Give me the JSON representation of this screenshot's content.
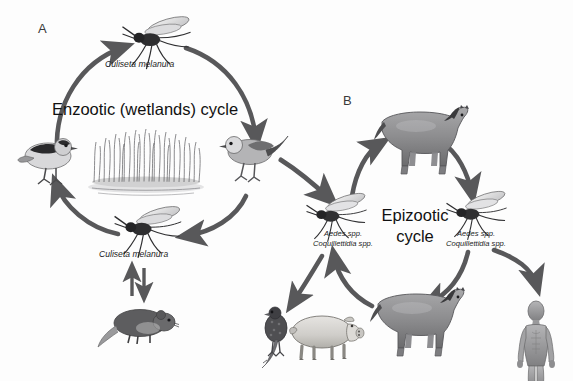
{
  "figure": {
    "background_color": "#fdfdfd",
    "arrow_color": "#58585a",
    "ink_color": "#1a1a1a"
  },
  "panels": [
    {
      "letter": "A",
      "title": "Enzootic (wetlands) cycle",
      "title_lines": [
        "Enzootic (wetlands) cycle"
      ]
    },
    {
      "letter": "B",
      "title": "Epizootic cycle",
      "title_lines": [
        "Epizootic",
        "cycle"
      ]
    }
  ],
  "vectors": {
    "enzootic_top": "Culiseta melanura",
    "enzootic_bottom": "Culiseta melanura",
    "epizootic_left": [
      "Aedes spp.",
      "Coquillettidia spp."
    ],
    "epizootic_right": [
      "Aedes spp.",
      "Coquillettidia spp."
    ]
  },
  "organisms": {
    "bird_left": "passerine-bird",
    "bird_right": "passerine-bird",
    "wetland": "marsh-grass-water",
    "rodent": "rodent",
    "horse_top": "horse",
    "horse_bottom": "horse",
    "pheasant": "pheasant",
    "pig": "pig",
    "human": "human-figure"
  }
}
